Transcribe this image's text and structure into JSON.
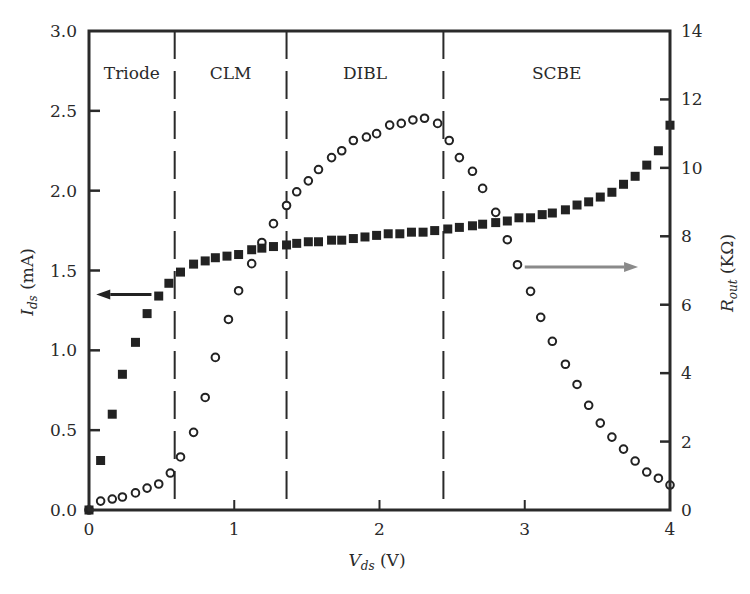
{
  "chart_data": {
    "type": "scatter",
    "title": "",
    "xlabel": "V_ds (V)",
    "xlabel_main": "V",
    "xlabel_sub": "ds",
    "xlabel_unit": " (V)",
    "ylabel_left": "I_ds (mA)",
    "ylabel_left_main": "I",
    "ylabel_left_sub": "ds",
    "ylabel_left_unit": " (mA)",
    "ylabel_right": "R_out (KΩ)",
    "ylabel_right_main": "R",
    "ylabel_right_sub": "out",
    "ylabel_right_unit": " (KΩ)",
    "xlim": [
      0,
      4
    ],
    "ylim_left": [
      0,
      3.0
    ],
    "ylim_right": [
      0,
      14
    ],
    "xticks": [
      0,
      1,
      2,
      3,
      4
    ],
    "xtick_labels": [
      "0",
      "1",
      "2",
      "3",
      "4"
    ],
    "yticks_left": [
      0,
      0.5,
      1.0,
      1.5,
      2.0,
      2.5,
      3.0
    ],
    "ytick_labels_left": [
      "0.0",
      "0.5",
      "1.0",
      "1.5",
      "2.0",
      "2.5",
      "3.0"
    ],
    "yticks_right": [
      0,
      2,
      4,
      6,
      8,
      10,
      12,
      14
    ],
    "ytick_labels_right": [
      "0",
      "2",
      "4",
      "6",
      "8",
      "10",
      "12",
      "14"
    ],
    "grid": false,
    "legend": null,
    "regions": [
      {
        "label": "Triode",
        "x_start": 0.0,
        "x_end": 0.59
      },
      {
        "label": "CLM",
        "x_start": 0.59,
        "x_end": 1.36
      },
      {
        "label": "DIBL",
        "x_start": 1.36,
        "x_end": 2.44
      },
      {
        "label": "SCBE",
        "x_start": 2.44,
        "x_end": 4.0
      }
    ],
    "region_boundaries": [
      0.59,
      1.36,
      2.44
    ],
    "annotations": [
      {
        "type": "arrow",
        "direction": "left",
        "points_to": "left axis (I_ds)",
        "x_from": 0.43,
        "x_to": 0.05,
        "y_left": 1.35,
        "color": "#222222"
      },
      {
        "type": "arrow",
        "direction": "right",
        "points_to": "right axis (R_out)",
        "x_from": 3.0,
        "x_to": 3.78,
        "y_right": 7.1,
        "color": "#8a8a8a"
      }
    ],
    "series": [
      {
        "name": "I_ds",
        "axis": "left",
        "marker": "filled-square",
        "color": "#222222",
        "x": [
          0.0,
          0.08,
          0.16,
          0.23,
          0.32,
          0.4,
          0.48,
          0.55,
          0.63,
          0.72,
          0.8,
          0.87,
          0.95,
          1.03,
          1.12,
          1.19,
          1.27,
          1.36,
          1.43,
          1.51,
          1.58,
          1.67,
          1.74,
          1.82,
          1.9,
          1.98,
          2.06,
          2.14,
          2.22,
          2.3,
          2.38,
          2.47,
          2.55,
          2.64,
          2.71,
          2.8,
          2.88,
          2.96,
          3.04,
          3.12,
          3.19,
          3.28,
          3.36,
          3.44,
          3.52,
          3.6,
          3.68,
          3.76,
          3.84,
          3.92,
          4.0
        ],
        "values": [
          0.0,
          0.31,
          0.6,
          0.85,
          1.05,
          1.23,
          1.34,
          1.42,
          1.49,
          1.54,
          1.56,
          1.58,
          1.59,
          1.6,
          1.63,
          1.64,
          1.65,
          1.66,
          1.67,
          1.68,
          1.68,
          1.69,
          1.69,
          1.7,
          1.71,
          1.72,
          1.73,
          1.73,
          1.74,
          1.74,
          1.75,
          1.76,
          1.77,
          1.78,
          1.79,
          1.8,
          1.81,
          1.83,
          1.83,
          1.85,
          1.86,
          1.88,
          1.91,
          1.93,
          1.96,
          1.99,
          2.04,
          2.09,
          2.16,
          2.25,
          2.41
        ]
      },
      {
        "name": "R_out",
        "axis": "right",
        "marker": "open-circle",
        "color": "#222222",
        "x": [
          0.0,
          0.08,
          0.16,
          0.23,
          0.32,
          0.4,
          0.48,
          0.56,
          0.63,
          0.72,
          0.8,
          0.87,
          0.96,
          1.03,
          1.12,
          1.19,
          1.27,
          1.36,
          1.43,
          1.51,
          1.58,
          1.67,
          1.74,
          1.82,
          1.91,
          1.98,
          2.07,
          2.15,
          2.23,
          2.31,
          2.4,
          2.48,
          2.55,
          2.64,
          2.71,
          2.8,
          2.88,
          2.95,
          3.04,
          3.11,
          3.19,
          3.28,
          3.36,
          3.44,
          3.52,
          3.6,
          3.68,
          3.76,
          3.84,
          3.92,
          4.0
        ],
        "values": [
          0.0,
          0.26,
          0.32,
          0.38,
          0.5,
          0.64,
          0.76,
          1.08,
          1.55,
          2.27,
          3.29,
          4.46,
          5.57,
          6.41,
          7.2,
          7.82,
          8.37,
          8.9,
          9.3,
          9.62,
          9.95,
          10.3,
          10.5,
          10.8,
          10.9,
          11.0,
          11.25,
          11.3,
          11.4,
          11.45,
          11.3,
          10.8,
          10.3,
          9.9,
          9.4,
          8.7,
          7.9,
          7.17,
          6.39,
          5.63,
          4.93,
          4.26,
          3.67,
          3.06,
          2.54,
          2.13,
          1.78,
          1.43,
          1.11,
          0.93,
          0.73
        ]
      }
    ]
  },
  "layout_px": {
    "plot_left": 89,
    "plot_right": 670,
    "plot_top": 31,
    "plot_bottom": 510
  }
}
